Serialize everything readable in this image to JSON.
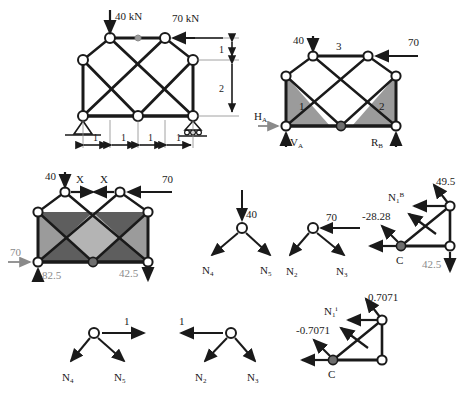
{
  "document": {
    "kind": "structural-truss-analysis-figure",
    "background_color": "#ffffff",
    "ink_color": "#1a1a1a",
    "gray_label_color": "#8a8a8a",
    "shade_dark": "#5e5e5e",
    "shade_mid": "#9b9b9b",
    "shade_light": "#c9c9c9"
  },
  "figure1": {
    "name": "original-truss-with-applied-loads",
    "loads": {
      "vertical_load": "40 kN",
      "horizontal_load": "70 kN"
    },
    "dimensions": {
      "horizontal": [
        "1",
        "1",
        "1",
        "1"
      ],
      "vertical": [
        "1",
        "2"
      ]
    },
    "supports": {
      "left": "pin-support",
      "right": "roller-support"
    }
  },
  "figure2": {
    "name": "truss-with-reactions-and-member-numbers",
    "loads": {
      "vertical_load": "40",
      "horizontal_load": "70"
    },
    "member_labels": {
      "top": "3",
      "left_panel": "1",
      "right_panel": "2"
    },
    "reactions": {
      "horizontal": "H",
      "horizontal_sub": "A",
      "vertical_left": "V",
      "vertical_left_sub": "A",
      "vertical_right": "R",
      "vertical_right_sub": "B"
    }
  },
  "figure3": {
    "name": "released-structure-with-redundant-X",
    "loads": {
      "vertical_load": "40",
      "horizontal_load": "70",
      "redundant_left": "X",
      "redundant_right": "X",
      "support_horizontal": "70"
    },
    "reactions": {
      "left_vertical": "82.5",
      "right_vertical": "42.5"
    }
  },
  "figure4": {
    "name": "joint-free-body-left-40kN",
    "applied": "40",
    "members": [
      "N",
      "N"
    ],
    "member_subs": [
      "4",
      "5"
    ]
  },
  "figure5": {
    "name": "joint-free-body-right-70kN",
    "applied": "70",
    "members": [
      "N",
      "N"
    ],
    "member_subs": [
      "2",
      "3"
    ]
  },
  "figure6": {
    "name": "section-free-body-real-load-system",
    "values": {
      "top_right": "49.5",
      "diagonal": "-28.28",
      "bottom_right": "42.5"
    },
    "labels": {
      "member_force": "N",
      "member_force_sub": "1",
      "member_force_sup": "B",
      "joint": "C"
    }
  },
  "figure7": {
    "name": "joint-free-body-unit-load-left",
    "applied": "1",
    "members": [
      "N",
      "N"
    ],
    "member_subs": [
      "4",
      "5"
    ]
  },
  "figure8": {
    "name": "joint-free-body-unit-load-right",
    "applied": "1",
    "members": [
      "N",
      "N"
    ],
    "member_subs": [
      "2",
      "3"
    ]
  },
  "figure9": {
    "name": "section-free-body-unit-load-system",
    "values": {
      "top_right": "0.7071",
      "diagonal": "-0.7071"
    },
    "labels": {
      "member_force": "N",
      "member_force_sub": "1",
      "member_force_sup": "i",
      "joint": "C"
    }
  }
}
